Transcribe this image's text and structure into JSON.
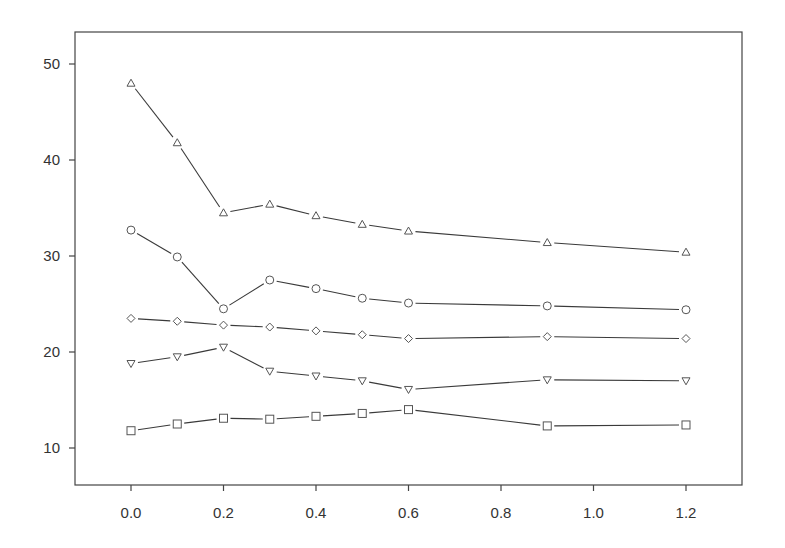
{
  "chart_data": {
    "type": "line",
    "title": "",
    "xlabel": "",
    "ylabel": "",
    "x": [
      0.0,
      0.1,
      0.2,
      0.3,
      0.4,
      0.5,
      0.6,
      0.9,
      1.2
    ],
    "xlim": [
      -0.12,
      1.32
    ],
    "ylim": [
      6.2,
      53.3
    ],
    "xticks": [
      0.0,
      0.2,
      0.4,
      0.6,
      0.8,
      1.0,
      1.2
    ],
    "xtick_labels": [
      "0.0",
      "0.2",
      "0.4",
      "0.6",
      "0.8",
      "1.0",
      "1.2"
    ],
    "yticks": [
      10,
      20,
      30,
      40,
      50
    ],
    "ytick_labels": [
      "10",
      "20",
      "30",
      "40",
      "50"
    ],
    "grid": false,
    "legend": null,
    "series": [
      {
        "name": "triangle-up",
        "marker": "triangle-up",
        "values": [
          48.0,
          41.8,
          34.5,
          35.4,
          34.2,
          33.3,
          32.6,
          31.4,
          30.4
        ]
      },
      {
        "name": "circle",
        "marker": "circle",
        "values": [
          32.7,
          29.9,
          24.5,
          27.5,
          26.6,
          25.6,
          25.1,
          24.8,
          24.4
        ]
      },
      {
        "name": "diamond",
        "marker": "diamond",
        "values": [
          23.5,
          23.2,
          22.8,
          22.6,
          22.2,
          21.8,
          21.4,
          21.6,
          21.4
        ]
      },
      {
        "name": "triangle-down",
        "marker": "triangle-down",
        "values": [
          18.8,
          19.5,
          20.5,
          18.0,
          17.5,
          17.0,
          16.1,
          17.1,
          17.0
        ]
      },
      {
        "name": "square",
        "marker": "square",
        "values": [
          11.8,
          12.5,
          13.1,
          13.0,
          13.3,
          13.6,
          14.0,
          12.3,
          12.4
        ]
      }
    ]
  },
  "colors": {
    "line": "#3a3a3a",
    "marker_stroke": "#555555",
    "axis": "#444444",
    "text": "#333333",
    "background": "#ffffff"
  }
}
